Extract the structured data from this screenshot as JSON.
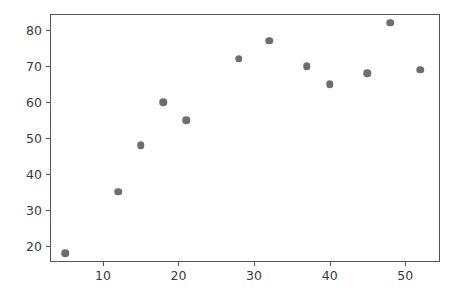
{
  "chart_data": {
    "type": "scatter",
    "title": "",
    "xlabel": "",
    "ylabel": "",
    "xlim": [
      3.0,
      54.6
    ],
    "ylim": [
      15.5,
      84.5
    ],
    "grid": false,
    "legend": null,
    "marker": {
      "shape": "circle",
      "color": "#6e6e6e",
      "size_px": 7.5
    },
    "xticks": [
      10,
      20,
      30,
      40,
      50
    ],
    "xtick_labels": [
      "10",
      "20",
      "30",
      "40",
      "50"
    ],
    "yticks": [
      20,
      30,
      40,
      50,
      60,
      70,
      80
    ],
    "ytick_labels": [
      "20",
      "30",
      "40",
      "50",
      "60",
      "70",
      "80"
    ],
    "series": [
      {
        "name": "series-1",
        "x": [
          5,
          12,
          15,
          18,
          21,
          28,
          32,
          37,
          40,
          45,
          48,
          52
        ],
        "y": [
          18,
          35,
          48,
          60,
          55,
          72,
          77,
          70,
          65,
          68,
          82,
          69
        ]
      }
    ],
    "points": [
      {
        "x": 5,
        "y": 18
      },
      {
        "x": 12,
        "y": 35
      },
      {
        "x": 15,
        "y": 48
      },
      {
        "x": 18,
        "y": 60
      },
      {
        "x": 21,
        "y": 55
      },
      {
        "x": 28,
        "y": 72
      },
      {
        "x": 32,
        "y": 77
      },
      {
        "x": 37,
        "y": 70
      },
      {
        "x": 40,
        "y": 65
      },
      {
        "x": 45,
        "y": 68
      },
      {
        "x": 48,
        "y": 82
      },
      {
        "x": 52,
        "y": 69
      }
    ]
  },
  "figure": {
    "background_color": "#ffffff",
    "axis_color": "#555555",
    "tick_label_color": "#3a3a3a"
  }
}
